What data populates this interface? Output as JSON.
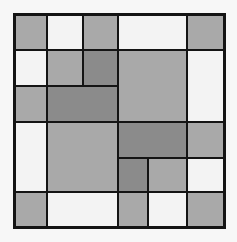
{
  "palette": {
    "white": "#f3f3f3",
    "gray": "#a9a9a9",
    "dark": "#8b8b8b",
    "line": "#141414"
  },
  "grid": {
    "columns": 6,
    "rows": 6
  },
  "cells": [
    {
      "name": "cell-r1-c1",
      "col": 1,
      "row": 1,
      "colspan": 1,
      "rowspan": 1,
      "tone": "gray"
    },
    {
      "name": "cell-r1-c2",
      "col": 2,
      "row": 1,
      "colspan": 1,
      "rowspan": 1,
      "tone": "white"
    },
    {
      "name": "cell-r1-c3",
      "col": 3,
      "row": 1,
      "colspan": 1,
      "rowspan": 1,
      "tone": "gray"
    },
    {
      "name": "cell-r1-c4",
      "col": 4,
      "row": 1,
      "colspan": 2,
      "rowspan": 1,
      "tone": "white"
    },
    {
      "name": "cell-r1-c6",
      "col": 6,
      "row": 1,
      "colspan": 1,
      "rowspan": 1,
      "tone": "gray"
    },
    {
      "name": "cell-r2-c1",
      "col": 1,
      "row": 2,
      "colspan": 1,
      "rowspan": 1,
      "tone": "white"
    },
    {
      "name": "cell-r2-c2",
      "col": 2,
      "row": 2,
      "colspan": 1,
      "rowspan": 1,
      "tone": "gray"
    },
    {
      "name": "cell-r2-c3",
      "col": 3,
      "row": 2,
      "colspan": 1,
      "rowspan": 1,
      "tone": "dark"
    },
    {
      "name": "cell-r2-c4",
      "col": 4,
      "row": 2,
      "colspan": 2,
      "rowspan": 2,
      "tone": "gray"
    },
    {
      "name": "cell-r2-c6",
      "col": 6,
      "row": 2,
      "colspan": 1,
      "rowspan": 2,
      "tone": "white"
    },
    {
      "name": "cell-r3-c1",
      "col": 1,
      "row": 3,
      "colspan": 1,
      "rowspan": 1,
      "tone": "gray"
    },
    {
      "name": "cell-r3-c2",
      "col": 2,
      "row": 3,
      "colspan": 2,
      "rowspan": 1,
      "tone": "dark"
    },
    {
      "name": "cell-r4-c1",
      "col": 1,
      "row": 4,
      "colspan": 1,
      "rowspan": 2,
      "tone": "white"
    },
    {
      "name": "cell-r4-c2",
      "col": 2,
      "row": 4,
      "colspan": 2,
      "rowspan": 2,
      "tone": "gray"
    },
    {
      "name": "cell-r4-c4",
      "col": 4,
      "row": 4,
      "colspan": 2,
      "rowspan": 1,
      "tone": "dark"
    },
    {
      "name": "cell-r4-c6",
      "col": 6,
      "row": 4,
      "colspan": 1,
      "rowspan": 1,
      "tone": "gray"
    },
    {
      "name": "cell-r5-c4",
      "col": 4,
      "row": 5,
      "colspan": 1,
      "rowspan": 1,
      "tone": "dark"
    },
    {
      "name": "cell-r5-c5",
      "col": 5,
      "row": 5,
      "colspan": 1,
      "rowspan": 1,
      "tone": "gray"
    },
    {
      "name": "cell-r5-c6",
      "col": 6,
      "row": 5,
      "colspan": 1,
      "rowspan": 1,
      "tone": "white"
    },
    {
      "name": "cell-r6-c1",
      "col": 1,
      "row": 6,
      "colspan": 1,
      "rowspan": 1,
      "tone": "gray"
    },
    {
      "name": "cell-r6-c2",
      "col": 2,
      "row": 6,
      "colspan": 2,
      "rowspan": 1,
      "tone": "white"
    },
    {
      "name": "cell-r6-c4",
      "col": 4,
      "row": 6,
      "colspan": 1,
      "rowspan": 1,
      "tone": "gray"
    },
    {
      "name": "cell-r6-c5",
      "col": 5,
      "row": 6,
      "colspan": 1,
      "rowspan": 1,
      "tone": "white"
    },
    {
      "name": "cell-r6-c6",
      "col": 6,
      "row": 6,
      "colspan": 1,
      "rowspan": 1,
      "tone": "gray"
    }
  ]
}
